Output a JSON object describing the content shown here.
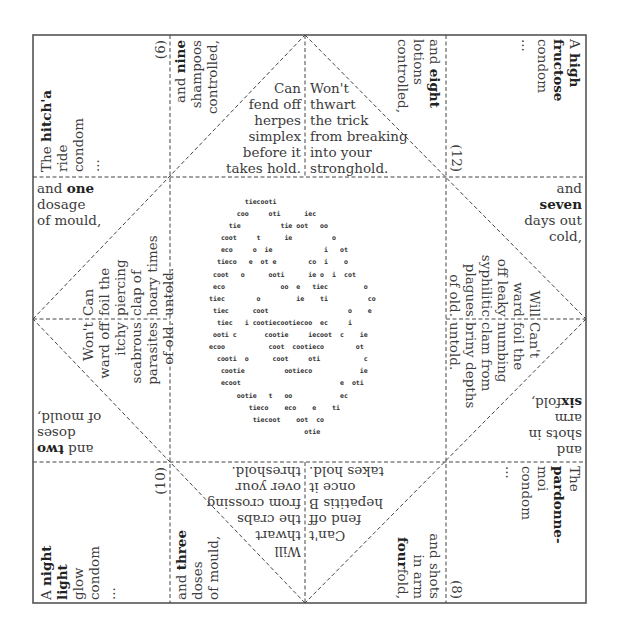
{
  "fortune_teller": {
    "corners": {
      "top_left": {
        "pre": "The ",
        "bold": "hitch'a",
        "post_lines": [
          "ride",
          "condom",
          "..."
        ]
      },
      "top_right": {
        "pre": "A ",
        "bold1": "high",
        "bold2": "fructose",
        "post_lines": [
          "condom",
          "..."
        ]
      },
      "bottom_left": {
        "pre": "A ",
        "bold1": "night",
        "bold2": "light",
        "post_lines": [
          "glow",
          "condom",
          "..."
        ]
      },
      "bottom_right": {
        "pre": "The ",
        "bold": "pardonne-",
        "post_lines": [
          "moi",
          "condom",
          "..."
        ]
      }
    },
    "numbers": {
      "n6": "(6)",
      "n12": "(12)",
      "n10": "(10)",
      "n8": "(8)"
    },
    "counts": {
      "one": {
        "pre": "and ",
        "bold": "one",
        "lines": [
          "dosage",
          "of mould,"
        ]
      },
      "two": {
        "pre": "and ",
        "bold": "two",
        "lines": [
          "doses",
          "of mould,"
        ]
      },
      "three": {
        "pre": "and ",
        "bold": "three",
        "lines": [
          "doses",
          "of mould,"
        ]
      },
      "four": {
        "lines": [
          "and shots",
          "in arm"
        ],
        "bold": "four",
        "post": "fold,"
      },
      "six": {
        "lines": [
          "and",
          "shots in",
          "arm"
        ],
        "bold": "six",
        "post": "fold,"
      },
      "seven": {
        "line1": "and",
        "bold": "seven",
        "lines": [
          "days out",
          "cold,"
        ]
      },
      "eight": {
        "pre": "and ",
        "bold": "eight",
        "lines": [
          "lotions",
          "controlled,"
        ]
      },
      "nine": {
        "pre": "and ",
        "bold": "nine",
        "lines": [
          "shampoos",
          "controlled,"
        ]
      }
    },
    "fortunes": {
      "top_left": [
        "Can",
        "fend off",
        "herpes",
        "simplex",
        "before it",
        "takes hold."
      ],
      "top_right": [
        "Won't",
        "thwart",
        "the trick",
        "from breaking",
        "into your",
        "stronghold."
      ],
      "right_top": [
        "Will",
        "ward",
        "off leaky",
        "syphilitic",
        "plagues",
        "of old."
      ],
      "right_bottom": [
        "Can't",
        "foil the",
        "numbing",
        "clam from",
        "briny depths",
        "untold."
      ],
      "bottom_right": [
        "Can't",
        "fend off",
        "hepatitis B",
        "once it",
        "takes hold."
      ],
      "bottom_left": [
        "Will",
        "thwart",
        "the crabs",
        "from crossing",
        "over your",
        "threshold."
      ],
      "left_bottom": [
        "Won't",
        "ward off",
        "itchy",
        "scabrous",
        "parasites",
        "of old."
      ],
      "left_top": [
        "Can",
        "foil the",
        "piercing",
        "clap of",
        "hoary times",
        "untold."
      ]
    },
    "center_ascii": [
      "          tiecooti",
      "        coo     oti      iec",
      "      tie          tie oot   oo",
      "    coot     t      ie          o",
      "    eco     o  ie             i   ot",
      "   tieco   e  ot e        co  i    o",
      "  coot   o      ooti      ie o  i  cot",
      "  eco              oo  e   tiec         o",
      " tiec        o         ie    ti          co",
      "  tiec      coot                    o    e",
      "   tiec   i cootiecootiecoo  ec     i",
      "  ooti c       cootie     iecoot  c    ie",
      " ecoo           coot  cootieco        ot",
      "   cooti  o      coot     oti           c",
      "    cootie          ootieco            ie",
      "    ecoot                         e  oti",
      "        ootie   t   oo            ec",
      "           tieco    eco    e    ti",
      "            tiecoot    oot  co",
      "                         otie"
    ]
  }
}
